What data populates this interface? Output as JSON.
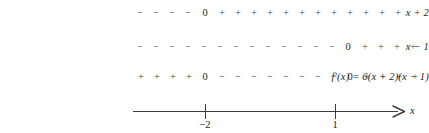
{
  "chart_data": {
    "type": "table",
    "title": "",
    "subtitle": "",
    "xlabel": "x",
    "ylabel": "",
    "grid": false,
    "legend": "none",
    "axis": {
      "variable": "x",
      "arrow_direction": "right",
      "ticks": [
        {
          "label": "−2",
          "value": -2,
          "position_px": 205
        },
        {
          "label": "1",
          "value": 1,
          "position_px": 335
        }
      ],
      "line_start_px": 133,
      "line_end_px": 398
    },
    "rows": [
      {
        "label": "x + 2",
        "factor": "x + 2",
        "zeros": [
          -2
        ],
        "intervals": [
          {
            "range": "(-inf, -2)",
            "sign": "-"
          },
          {
            "range": "(-2, inf)",
            "sign": "+"
          }
        ],
        "cells": [
          {
            "glyph": "−",
            "kind": "minus",
            "x": 140
          },
          {
            "glyph": "−",
            "kind": "minus",
            "x": 156
          },
          {
            "glyph": "−",
            "kind": "minus",
            "x": 172
          },
          {
            "glyph": "−",
            "kind": "minus",
            "x": 188
          },
          {
            "glyph": "0",
            "kind": "zero",
            "x": 205
          },
          {
            "glyph": "+",
            "kind": "plus",
            "x": 222
          },
          {
            "glyph": "+",
            "kind": "plus",
            "x": 238
          },
          {
            "glyph": "+",
            "kind": "plus",
            "x": 254
          },
          {
            "glyph": "+",
            "kind": "plus",
            "x": 270
          },
          {
            "glyph": "+",
            "kind": "plus",
            "x": 286
          },
          {
            "glyph": "+",
            "kind": "plus",
            "x": 302
          },
          {
            "glyph": "+",
            "kind": "plus",
            "x": 318
          },
          {
            "glyph": "+",
            "kind": "plus",
            "x": 334
          },
          {
            "glyph": "+",
            "kind": "plus",
            "x": 350
          },
          {
            "glyph": "+",
            "kind": "plus",
            "x": 366
          },
          {
            "glyph": "+",
            "kind": "plus",
            "x": 382
          },
          {
            "glyph": "+",
            "kind": "plus",
            "x": 398
          }
        ]
      },
      {
        "label": "x − 1",
        "factor": "x - 1",
        "zeros": [
          1
        ],
        "intervals": [
          {
            "range": "(-inf, 1)",
            "sign": "-"
          },
          {
            "range": "(1, inf)",
            "sign": "+"
          }
        ],
        "cells": [
          {
            "glyph": "−",
            "kind": "minus",
            "x": 140
          },
          {
            "glyph": "−",
            "kind": "minus",
            "x": 156
          },
          {
            "glyph": "−",
            "kind": "minus",
            "x": 172
          },
          {
            "glyph": "−",
            "kind": "minus",
            "x": 188
          },
          {
            "glyph": "−",
            "kind": "minus",
            "x": 204
          },
          {
            "glyph": "−",
            "kind": "minus",
            "x": 220
          },
          {
            "glyph": "−",
            "kind": "minus",
            "x": 236
          },
          {
            "glyph": "−",
            "kind": "minus",
            "x": 252
          },
          {
            "glyph": "−",
            "kind": "minus",
            "x": 268
          },
          {
            "glyph": "−",
            "kind": "minus",
            "x": 284
          },
          {
            "glyph": "−",
            "kind": "minus",
            "x": 300
          },
          {
            "glyph": "−",
            "kind": "minus",
            "x": 316
          },
          {
            "glyph": "−",
            "kind": "minus",
            "x": 332
          },
          {
            "glyph": "0",
            "kind": "zero",
            "x": 348
          },
          {
            "glyph": "+",
            "kind": "plus",
            "x": 365
          },
          {
            "glyph": "+",
            "kind": "plus",
            "x": 381
          },
          {
            "glyph": "+",
            "kind": "plus",
            "x": 397
          },
          {
            "glyph": "+",
            "kind": "plus",
            "x": 413
          }
        ]
      },
      {
        "label": "f′(x) = 6(x + 2)(x − 1)",
        "factor": "f'(x) = 6(x + 2)(x - 1)",
        "zeros": [
          -2,
          1
        ],
        "intervals": [
          {
            "range": "(-inf, -2)",
            "sign": "+"
          },
          {
            "range": "(-2, 1)",
            "sign": "-"
          },
          {
            "range": "(1, inf)",
            "sign": "+"
          }
        ],
        "cells": [
          {
            "glyph": "+",
            "kind": "plus",
            "x": 141
          },
          {
            "glyph": "+",
            "kind": "plus",
            "x": 157
          },
          {
            "glyph": "+",
            "kind": "plus",
            "x": 173
          },
          {
            "glyph": "+",
            "kind": "plus",
            "x": 189
          },
          {
            "glyph": "0",
            "kind": "zero",
            "x": 205
          },
          {
            "glyph": "−",
            "kind": "minus",
            "x": 222
          },
          {
            "glyph": "−",
            "kind": "minus",
            "x": 238
          },
          {
            "glyph": "−",
            "kind": "minus",
            "x": 254
          },
          {
            "glyph": "−",
            "kind": "minus",
            "x": 270
          },
          {
            "glyph": "−",
            "kind": "minus",
            "x": 286
          },
          {
            "glyph": "−",
            "kind": "minus",
            "x": 302
          },
          {
            "glyph": "−",
            "kind": "minus",
            "x": 318
          },
          {
            "glyph": "−",
            "kind": "minus",
            "x": 334
          },
          {
            "glyph": "0",
            "kind": "zero",
            "x": 350
          },
          {
            "glyph": "+",
            "kind": "plus",
            "x": 367
          },
          {
            "glyph": "+",
            "kind": "plus",
            "x": 383
          },
          {
            "glyph": "+",
            "kind": "plus",
            "x": 399
          },
          {
            "glyph": "+",
            "kind": "plus",
            "x": 415
          }
        ]
      }
    ],
    "colors": {
      "ink": "#231f20",
      "sign_ink": "#4a4a4c",
      "axis": "#3c3c3e",
      "background": "#ffffff"
    }
  }
}
